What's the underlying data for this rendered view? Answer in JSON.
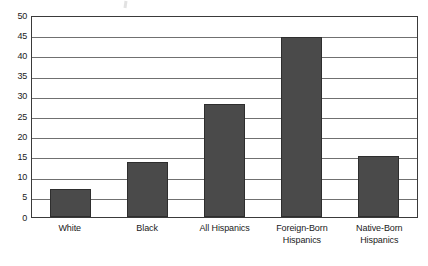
{
  "chart_data": {
    "type": "bar",
    "title": "",
    "subtitle": "",
    "xlabel": "",
    "ylabel": "",
    "categories": [
      "White",
      "Black",
      "All Hispanics",
      "Foreign-Born Hispanics",
      "Native-Born Hispanics"
    ],
    "category_lines": [
      [
        "White",
        ""
      ],
      [
        "Black",
        ""
      ],
      [
        "All Hispanics",
        ""
      ],
      [
        "Foreign-Born",
        "Hispanics"
      ],
      [
        "Native-Born",
        "Hispanics"
      ]
    ],
    "values": [
      7,
      13.5,
      28,
      44.5,
      15
    ],
    "ylim": [
      0,
      50
    ],
    "ytick_labels": [
      "50",
      "45",
      "40",
      "35",
      "30",
      "25",
      "20",
      "15",
      "10",
      "5",
      "0"
    ],
    "ytick_values": [
      50,
      45,
      40,
      35,
      30,
      25,
      20,
      15,
      10,
      5,
      0
    ],
    "ytick_step": 5,
    "grid": true,
    "legend": "none",
    "bar_color": "#4a4a4a",
    "bar_edge_color": "#2e2e2e",
    "gridline_color": "#707070",
    "axis_color": "#3a3a3a",
    "background_color": "#ffffff",
    "text_color": "#1a1a1a"
  }
}
